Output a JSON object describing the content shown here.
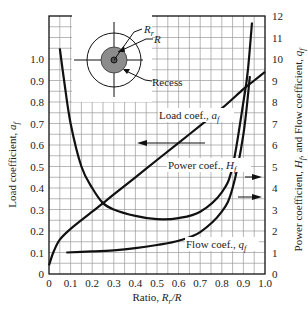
{
  "chart_data": {
    "type": "line",
    "title": "",
    "xlabel": "Ratio, R_r/R",
    "ylabel_left": "Load coefficient, a_f",
    "ylabel_right": "Power coefficient, H_f, and Flow coefficient, q_f",
    "xlim": [
      0,
      1.0
    ],
    "ylim_left": [
      0,
      1.2
    ],
    "ylim_right": [
      0,
      12
    ],
    "grid": true,
    "x_ticks": [
      "0",
      "0.1",
      "0.2",
      "0.3",
      "0.4",
      "0.5",
      "0.6",
      "0.7",
      "0.8",
      "0.9",
      "1.0"
    ],
    "y_left_ticks": [
      "0",
      "0.1",
      "0.2",
      "0.3",
      "0.4",
      "0.5",
      "0.6",
      "0.7",
      "0.8",
      "0.9",
      "1.0"
    ],
    "y_right_ticks": [
      "0",
      "1",
      "2",
      "3",
      "4",
      "5",
      "6",
      "7",
      "8",
      "9",
      "10",
      "11",
      "12"
    ],
    "series": [
      {
        "name": "Load coef., a_f",
        "axis": "left",
        "x": [
          0,
          0.02,
          0.05,
          0.1,
          0.2,
          0.25,
          0.3,
          0.4,
          0.5,
          0.6,
          0.7,
          0.8,
          0.9,
          0.95,
          1.0
        ],
        "y": [
          0.04,
          0.1,
          0.16,
          0.21,
          0.29,
          0.33,
          0.37,
          0.45,
          0.53,
          0.61,
          0.69,
          0.77,
          0.86,
          0.9,
          0.94
        ]
      },
      {
        "name": "Power coef., H_f",
        "axis": "right",
        "x": [
          0.05,
          0.07,
          0.1,
          0.15,
          0.2,
          0.25,
          0.3,
          0.4,
          0.5,
          0.6,
          0.7,
          0.8,
          0.85,
          0.9,
          0.92,
          0.94
        ],
        "y": [
          10.5,
          9,
          7,
          5,
          4,
          3.3,
          3,
          2.7,
          2.55,
          2.6,
          2.9,
          3.8,
          5,
          8,
          9.4,
          11.7
        ]
      },
      {
        "name": "Flow coef., q_f",
        "axis": "right",
        "x": [
          0.08,
          0.2,
          0.3,
          0.4,
          0.5,
          0.6,
          0.7,
          0.8,
          0.85,
          0.9,
          0.93
        ],
        "y": [
          1,
          1.05,
          1.1,
          1.2,
          1.35,
          1.55,
          1.95,
          2.9,
          4,
          6.5,
          9.2
        ]
      }
    ],
    "annotations": [
      {
        "text": "Load coef., a_f",
        "arrow": "left"
      },
      {
        "text": "Power coef., H_f",
        "arrow": "right"
      },
      {
        "text": "Flow coef., q_f",
        "arrow": "right"
      }
    ],
    "inset": {
      "labels": [
        "R_r",
        "R",
        "Recess"
      ]
    }
  },
  "labels": {
    "x_axis_main": "Ratio, ",
    "x_axis_var": "R",
    "x_axis_sub": "r",
    "x_axis_tail": "/R",
    "load_label": "Load coef., ",
    "load_var": "a",
    "load_sub": "f",
    "power_label": "Power coef., ",
    "power_var": "H",
    "power_sub": "f",
    "flow_label": "Flow coef., ",
    "flow_var": "q",
    "flow_sub": "f",
    "left_axis_text": "Load coefficient, ",
    "left_axis_var": "a",
    "left_axis_sub": "f",
    "right_axis_text_1": "Power coefficient, ",
    "right_axis_var_1": "H",
    "right_axis_sub_1": "f",
    "right_axis_text_2": ", and Flow coefficient, ",
    "right_axis_var_2": "q",
    "right_axis_sub_2": "f",
    "inset_rr_var": "R",
    "inset_rr_sub": "r",
    "inset_r": "R",
    "inset_recess": "Recess"
  }
}
